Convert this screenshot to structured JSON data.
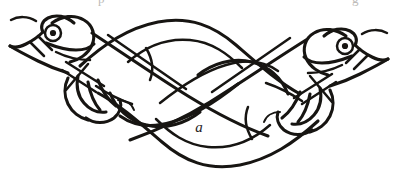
{
  "figure": {
    "kind": "line-drawing",
    "style": "insular-celtic-knotwork",
    "label": "a",
    "ink_color": "#171512",
    "paper_color": "#ffffff",
    "symmetry": "180-degree rotational",
    "creature_count": 2,
    "heads": [
      {
        "id": "left-head",
        "side": "left",
        "facing": "right",
        "eye": "concentric-circle",
        "has_jaw": true,
        "has_crest": true
      },
      {
        "id": "right-head",
        "side": "right",
        "facing": "left",
        "eye": "concentric-circle",
        "has_jaw": true,
        "has_crest": true
      }
    ],
    "limbs": [
      {
        "id": "left-limb",
        "side": "left",
        "type": "foreleg-with-claw"
      },
      {
        "id": "right-limb",
        "side": "right",
        "type": "foreleg-with-claw"
      }
    ],
    "page_bleed": {
      "left_fragment": "p",
      "right_fragment": "g"
    }
  }
}
